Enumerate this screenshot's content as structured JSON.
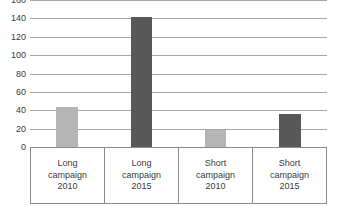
{
  "chart_data": {
    "type": "bar",
    "title": "",
    "subtitle": "",
    "xlabel": "",
    "ylabel": "",
    "categories": [
      "Long campaign 2010",
      "Long campaign 2015",
      "Short campaign 2010",
      "Short campaign 2015"
    ],
    "category_lines": [
      [
        "Long",
        "campaign",
        "2010"
      ],
      [
        "Long",
        "campaign",
        "2015"
      ],
      [
        "Short",
        "campaign",
        "2010"
      ],
      [
        "Short",
        "campaign",
        "2015"
      ]
    ],
    "values": [
      44,
      141,
      19,
      36
    ],
    "bar_colors": [
      "#b5b5b5",
      "#585858",
      "#b5b5b5",
      "#585858"
    ],
    "ylim": [
      0,
      160
    ],
    "yticks": [
      160,
      140,
      120,
      100,
      80,
      60,
      40,
      20,
      0
    ],
    "ytick_labels": [
      "160",
      "140",
      "120",
      "100",
      "80",
      "60",
      "40",
      "20",
      "0"
    ],
    "grid": true,
    "grid_color": "#a6a6a6",
    "legend": null,
    "legend_position": "none",
    "annotations": []
  },
  "colors": {
    "background": "#ffffff",
    "light_bar": "#b5b5b5",
    "dark_bar": "#585858",
    "gridline": "#a6a6a6",
    "axis_line": "#7f7f7f",
    "table_border": "#8c8c8c",
    "text": "#3b3b3b"
  }
}
